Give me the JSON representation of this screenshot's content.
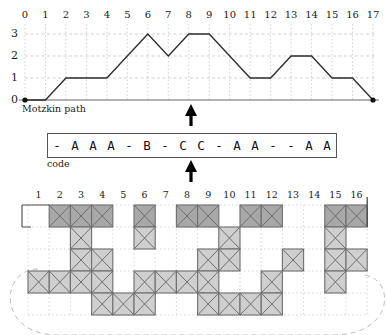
{
  "figure": {
    "panels": [
      "motzkin-path",
      "code",
      "cylindric-diagram"
    ]
  },
  "motzkin": {
    "caption": "Motzkin path",
    "x_ticks": [
      "0",
      "1",
      "2",
      "3",
      "4",
      "5",
      "6",
      "7",
      "8",
      "9",
      "10",
      "11",
      "12",
      "13",
      "14",
      "15",
      "16",
      "17"
    ],
    "y_ticks": [
      "0",
      "1",
      "2",
      "3"
    ],
    "axis_color": "#999999",
    "path_color": "#2b2b2b",
    "grid_color": "#bbbbbb"
  },
  "code": {
    "caption": "code",
    "symbols": [
      "-",
      "A",
      "A",
      "A",
      "-",
      "B",
      "-",
      "C",
      "C",
      "-",
      "A",
      "A",
      "-",
      "-",
      "A",
      "A"
    ],
    "border_color": "#555555"
  },
  "arrows": {
    "upper_arrow_name": "up-arrow-to-path",
    "lower_arrow_name": "up-arrow-to-code",
    "color": "#000000"
  },
  "tableau": {
    "col_numbers": [
      "1",
      "2",
      "3",
      "4",
      "5",
      "6",
      "7",
      "8",
      "9",
      "10",
      "11",
      "12",
      "13",
      "14",
      "15",
      "16"
    ],
    "rows": 5,
    "cols": 16,
    "fill_dark": "#a8a8a8",
    "fill_light": "#cfcfcf",
    "cell_border": "#6e6e6e",
    "dotted_color": "#cccccc",
    "dashed_color": "#bbbbbb",
    "filled_cells": [
      {
        "row": 1,
        "cols": [
          2,
          3,
          4,
          6,
          8,
          9,
          11,
          12,
          15,
          16
        ],
        "shade": "dark"
      },
      {
        "row": 2,
        "cols": [
          3,
          6,
          10,
          15
        ],
        "shade": "light"
      },
      {
        "row": 3,
        "cols": [
          3,
          4,
          9,
          10,
          13,
          15,
          16
        ],
        "shade": "light"
      },
      {
        "row": 4,
        "cols": [
          1,
          2,
          3,
          4,
          6,
          7,
          8,
          9,
          12,
          15
        ],
        "shade": "light"
      },
      {
        "row": 5,
        "cols": [
          4,
          5,
          6,
          9,
          10,
          11,
          12
        ],
        "shade": "light"
      }
    ]
  },
  "chart_data": {
    "type": "line",
    "title": "Motzkin path",
    "xlabel": "",
    "ylabel": "",
    "x": [
      0,
      1,
      2,
      3,
      4,
      5,
      6,
      7,
      8,
      9,
      10,
      11,
      12,
      13,
      14,
      15,
      16,
      17
    ],
    "values": [
      0,
      0,
      1,
      1,
      1,
      2,
      3,
      2,
      3,
      3,
      2,
      1,
      1,
      2,
      2,
      1,
      1,
      0
    ],
    "categories": [
      "0",
      "1",
      "2",
      "3",
      "4",
      "5",
      "6",
      "7",
      "8",
      "9",
      "10",
      "11",
      "12",
      "13",
      "14",
      "15",
      "16",
      "17"
    ],
    "xlim": [
      0,
      17
    ],
    "ylim": [
      0,
      3
    ],
    "grid": true,
    "legend": "none",
    "annotations": [
      "Motzkin path",
      "code"
    ]
  }
}
